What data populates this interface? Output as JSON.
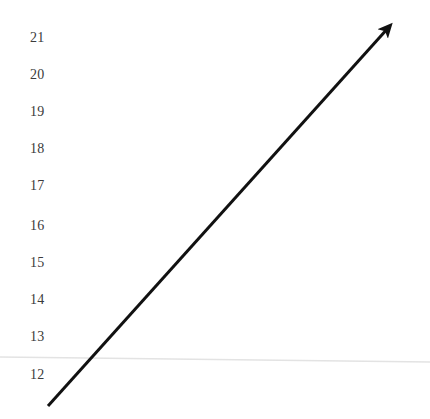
{
  "chart_data": {
    "type": "line",
    "title": "",
    "subtitle": "",
    "xlabel": "",
    "ylabel": "",
    "grid": true,
    "legend": null,
    "legend_position": "none",
    "y_tick_labels": [
      "21",
      "20",
      "19",
      "18",
      "17",
      "16",
      "15",
      "14",
      "13",
      "12"
    ],
    "y_tick_values": [
      21,
      20,
      19,
      18,
      17,
      16,
      15,
      14,
      13,
      12
    ],
    "ylim": [
      11.4,
      21.5
    ],
    "x_tick_labels": [],
    "xlim": [
      0,
      10
    ],
    "series": [
      {
        "name": "trend",
        "style": "arrow",
        "color": "#111111",
        "line_width": 3,
        "x": [
          0.35,
          10.0
        ],
        "values": [
          11.4,
          21.6
        ],
        "annotation": "upward arrow"
      }
    ],
    "gridlines": [
      {
        "axis": "y",
        "value": 12.3,
        "color": "#e3e3e3",
        "note": "faint near-horizontal rule just above the 12 label"
      }
    ],
    "annotations": [
      {
        "type": "arrowhead",
        "at_x": 10.0,
        "at_y": 21.6,
        "direction": "up-right"
      }
    ]
  },
  "figure": {
    "background_color": "#ffffff",
    "label_color": "#3b3b3b",
    "line_color": "#111111",
    "grid_color": "#e3e3e3",
    "width": 430,
    "height": 419
  },
  "geometry": {
    "label_x": 30,
    "label_tops": [
      31,
      68,
      105,
      142,
      179,
      219,
      256,
      293,
      330,
      368
    ],
    "line_start": {
      "x": 48,
      "y": 406
    },
    "line_end": {
      "x": 397,
      "y": 18
    },
    "grid_left": {
      "x": 0,
      "y": 357
    },
    "grid_right": {
      "x": 430,
      "y": 362
    }
  }
}
